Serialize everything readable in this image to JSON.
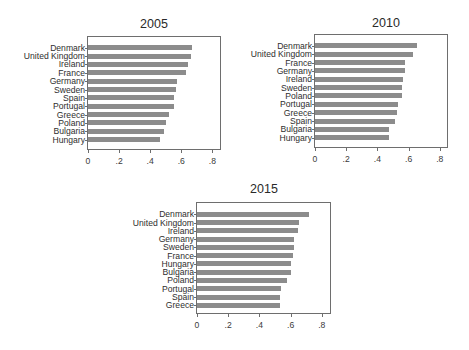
{
  "chart_data": [
    {
      "type": "bar",
      "orientation": "horizontal",
      "title": "2005",
      "xlabel": "",
      "ylabel": "",
      "xlim": [
        0,
        0.85
      ],
      "xticks": [
        0,
        0.2,
        0.4,
        0.6,
        0.8
      ],
      "xtick_labels": [
        "0",
        ".2",
        ".4",
        ".6",
        ".8"
      ],
      "grid": false,
      "legend": null,
      "categories": [
        "Denmark",
        "United Kingdom",
        "Ireland",
        "France",
        "Germany",
        "Sweden",
        "Spain",
        "Portugal",
        "Greece",
        "Poland",
        "Bulgaria",
        "Hungary"
      ],
      "values": [
        0.67,
        0.665,
        0.64,
        0.63,
        0.575,
        0.565,
        0.555,
        0.555,
        0.52,
        0.5,
        0.49,
        0.46
      ]
    },
    {
      "type": "bar",
      "orientation": "horizontal",
      "title": "2010",
      "xlabel": "",
      "ylabel": "",
      "xlim": [
        0,
        0.85
      ],
      "xticks": [
        0,
        0.2,
        0.4,
        0.6,
        0.8
      ],
      "xtick_labels": [
        "0",
        ".2",
        ".4",
        ".6",
        ".8"
      ],
      "grid": false,
      "legend": null,
      "categories": [
        "Denmark",
        "United Kingdom",
        "France",
        "Germany",
        "Ireland",
        "Sweden",
        "Poland",
        "Portugal",
        "Greece",
        "Spain",
        "Bulgaria",
        "Hungary"
      ],
      "values": [
        0.655,
        0.63,
        0.58,
        0.575,
        0.565,
        0.56,
        0.555,
        0.535,
        0.525,
        0.51,
        0.475,
        0.475
      ]
    },
    {
      "type": "bar",
      "orientation": "horizontal",
      "title": "2015",
      "xlabel": "",
      "ylabel": "",
      "xlim": [
        0,
        0.85
      ],
      "xticks": [
        0,
        0.2,
        0.4,
        0.6,
        0.8
      ],
      "xtick_labels": [
        "0",
        ".2",
        ".4",
        ".6",
        ".8"
      ],
      "grid": false,
      "legend": null,
      "categories": [
        "Denmark",
        "United Kingdom",
        "Ireland",
        "Germany",
        "Sweden",
        "France",
        "Hungary",
        "Bulgaria",
        "Poland",
        "Portugal",
        "Spain",
        "Greece"
      ],
      "values": [
        0.715,
        0.655,
        0.645,
        0.62,
        0.62,
        0.615,
        0.605,
        0.6,
        0.575,
        0.54,
        0.535,
        0.535
      ]
    }
  ],
  "style": {
    "bar_color": "#8c8c8c",
    "frame_color": "#6e6e6e",
    "text_color": "#2e2e2e"
  }
}
